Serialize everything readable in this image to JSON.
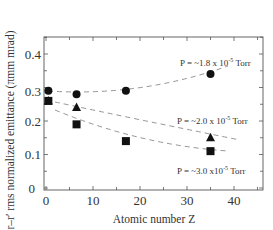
{
  "chart_data": {
    "type": "scatter",
    "title": "",
    "xlabel": "Atomic number Z",
    "ylabel": "r–r′ rms normalized emittance (πmm mrad)",
    "xlim": [
      -0.5,
      46
    ],
    "ylim": [
      0,
      0.45
    ],
    "xticks": [
      0,
      10,
      20,
      30,
      40
    ],
    "yticks": [
      0,
      0.1,
      0.2,
      0.3,
      0.4
    ],
    "xtick_labels": [
      "0",
      "10",
      "20",
      "30",
      "40"
    ],
    "ytick_labels": [
      "0",
      "0.1",
      "0.2",
      "0.3",
      "0.4"
    ],
    "grid": false,
    "legend": "none (inline annotations)",
    "series": [
      {
        "name": "P = ~1.8 x 10^-5 Torr",
        "marker": "circle",
        "x": [
          0.5,
          6.5,
          17,
          35
        ],
        "y": [
          0.29,
          0.28,
          0.29,
          0.34
        ],
        "fit": "dashed quadratic trend"
      },
      {
        "name": "P = ~2.0 x 10^-5 Torr",
        "marker": "triangle",
        "x": [
          0.5,
          6.5,
          35
        ],
        "y": [
          0.26,
          0.24,
          0.15
        ],
        "fit": "dashed trend"
      },
      {
        "name": "P = ~3.0 x 10^-5 Torr",
        "marker": "square",
        "x": [
          0.5,
          6.5,
          17,
          35
        ],
        "y": [
          0.26,
          0.19,
          0.14,
          0.11
        ],
        "fit": "dashed trend"
      }
    ],
    "annotations": [
      {
        "text": "P = ~1.8 x 10",
        "exp": "-5",
        "unit": " Torr",
        "series": "circle"
      },
      {
        "text": "P = ~2.0 x 10",
        "exp": "-5",
        "unit": " Torr",
        "series": "triangle"
      },
      {
        "text": "P = ~3.0 x10",
        "exp": "-5",
        "unit": " Torr",
        "series": "square"
      }
    ]
  },
  "labels": {
    "xlabel": "Atomic number Z",
    "ylabel": "r–r′ rms normalized emittance (πmm mrad)",
    "x0": "0",
    "x10": "10",
    "x20": "20",
    "x30": "30",
    "x40": "40",
    "y0": "0",
    "y1": "0.1",
    "y2": "0.2",
    "y3": "0.3",
    "y4": "0.4",
    "a1_base": "P = ~1.8 x 10",
    "a1_exp": "-5",
    "a1_unit": " Torr",
    "a2_base": "P = ~2.0 x 10",
    "a2_exp": "-5",
    "a2_unit": " Torr",
    "a3_base": "P = ~3.0 x10",
    "a3_exp": "-5",
    "a3_unit": " Torr"
  },
  "colors": {
    "marker": "#111111",
    "frame": "#555555",
    "dash": "#8a8a8a"
  }
}
